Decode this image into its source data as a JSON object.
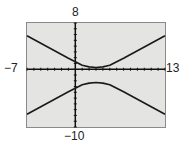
{
  "chart_data": {
    "type": "line",
    "title": "",
    "xlabel": "",
    "ylabel": "",
    "window": {
      "xmin": -7,
      "xmax": 13,
      "ymin": -10,
      "ymax": 8,
      "xscl": 1,
      "yscl": 1
    },
    "xlim": [
      -7,
      13
    ],
    "ylim": [
      -10,
      8
    ],
    "grid": false,
    "legend": null,
    "series": [
      {
        "name": "upper branch",
        "x": [
          -7,
          -5,
          -3,
          -1,
          0,
          1,
          2,
          3,
          4,
          5,
          6,
          7,
          9,
          11,
          13
        ],
        "y": [
          5.8,
          4.5,
          3.2,
          1.9,
          1.3,
          0.7,
          0.4,
          0.3,
          0.4,
          0.7,
          1.3,
          1.9,
          3.2,
          4.5,
          5.8
        ]
      },
      {
        "name": "lower branch",
        "x": [
          -7,
          -5,
          -3,
          -1,
          0,
          1,
          2,
          3,
          4,
          5,
          6,
          7,
          9,
          11,
          13
        ],
        "y": [
          -7.8,
          -6.5,
          -5.2,
          -3.9,
          -3.3,
          -2.7,
          -2.4,
          -2.3,
          -2.4,
          -2.7,
          -3.3,
          -3.9,
          -5.2,
          -6.5,
          -7.8
        ]
      }
    ],
    "tick_labels": {
      "xmin": "−7",
      "xmax": "13",
      "ymin": "−10",
      "ymax": "8"
    }
  },
  "colors": {
    "screen_bg": "#e4e4e2",
    "screen_border": "#8a8a8a",
    "curve": "#1a1a1a",
    "axes": "#111111"
  }
}
